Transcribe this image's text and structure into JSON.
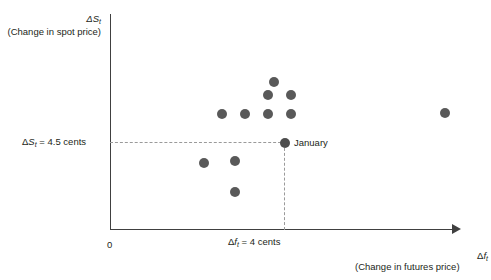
{
  "figure": {
    "background": "#ffffff",
    "axis_color": "#404040",
    "point_color": "#595959",
    "dash_color": "#9a9a9a",
    "origin_label": "0",
    "january_label": "January"
  },
  "chart_data": {
    "type": "scatter",
    "title": "",
    "xlabel": "(Change in futures price)",
    "ylabel": "(Change in spot price)",
    "x_axis_symbol": "Δf",
    "x_axis_subscript": "t",
    "y_axis_symbol": "ΔS",
    "y_axis_subscript": "t",
    "y_reference_label": "ΔS_t = 4.5 cents",
    "y_reference_value": 4.5,
    "y_reference_units": "cents",
    "x_reference_label": "Δf_t = 4 cents",
    "x_reference_value": 4,
    "x_reference_units": "cents",
    "grid": false,
    "legend": null,
    "annotations": [
      {
        "text": "January",
        "x": 4,
        "y": 4.5
      }
    ],
    "highlighted_point": {
      "label": "January",
      "x": 4,
      "y": 4.5
    },
    "points": [
      {
        "px": 222,
        "py": 114
      },
      {
        "px": 245,
        "py": 114
      },
      {
        "px": 268,
        "py": 114
      },
      {
        "px": 291,
        "py": 114
      },
      {
        "px": 268,
        "py": 95
      },
      {
        "px": 291,
        "py": 95
      },
      {
        "px": 274,
        "py": 82
      },
      {
        "px": 445,
        "py": 113
      },
      {
        "px": 204,
        "py": 163
      },
      {
        "px": 235,
        "py": 161
      },
      {
        "px": 235,
        "py": 192
      },
      {
        "px": 285,
        "py": 143
      }
    ]
  }
}
